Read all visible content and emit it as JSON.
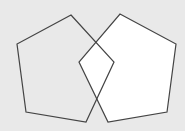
{
  "diagram": {
    "background": "#e9e9e9",
    "stroke_color": "#444444",
    "shapes": [
      {
        "name": "left-pentagon",
        "points": "71,15 114,62 86,122 26,112 17,44",
        "fill": "#e9e9e9"
      },
      {
        "name": "right-pentagon",
        "points": "120,14 176,44 167,112 108,122 79,62",
        "fill": "#ffffff"
      }
    ]
  }
}
